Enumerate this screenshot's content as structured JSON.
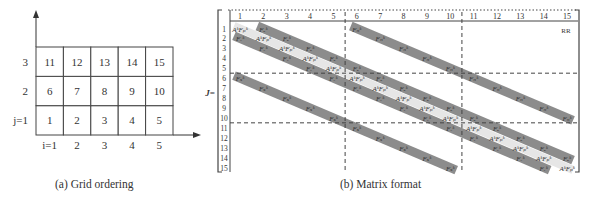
{
  "panel_a": {
    "caption": "(a) Grid ordering",
    "x_labels": [
      "i=1",
      "2",
      "3",
      "4",
      "5"
    ],
    "y_labels": [
      "j=1",
      "2",
      "3"
    ],
    "rows": [
      [
        "1",
        "2",
        "3",
        "4",
        "5"
      ],
      [
        "6",
        "7",
        "8",
        "9",
        "10"
      ],
      [
        "11",
        "12",
        "13",
        "14",
        "15"
      ]
    ]
  },
  "panel_b": {
    "caption": "(b) Matrix format",
    "matrix_label": "J=",
    "corner_label": "RR",
    "column_labels": [
      "1",
      "2",
      "3",
      "4",
      "5",
      "6",
      "7",
      "8",
      "9",
      "10",
      "11",
      "12",
      "13",
      "14",
      "15"
    ],
    "row_labels": [
      "1",
      "2",
      "3",
      "4",
      "5",
      "6",
      "7",
      "8",
      "9",
      "10",
      "11",
      "12",
      "13",
      "14",
      "15"
    ],
    "block_dividers": {
      "after_columns": [
        5,
        10
      ],
      "after_rows": [
        5,
        10
      ]
    },
    "bands": [
      {
        "name": "main-diagonal",
        "offset": 0,
        "style": "light",
        "label": "AᵏFₚᵏ"
      },
      {
        "name": "east-diagonal",
        "offset": 1,
        "style": "dark",
        "label": "Fₑᵏ"
      },
      {
        "name": "west-diagonal",
        "offset": -1,
        "style": "dark",
        "label": "Fᵥᵏ"
      },
      {
        "name": "north-diagonal",
        "offset": 5,
        "style": "dark",
        "label": "Fₙᵏ"
      },
      {
        "name": "south-diagonal",
        "offset": -5,
        "style": "dark",
        "label": "Fₛᵏ"
      }
    ],
    "colors": {
      "dark_band": "#8c8c8c",
      "light_band": "#e6e6e6",
      "line": "#444444"
    }
  }
}
